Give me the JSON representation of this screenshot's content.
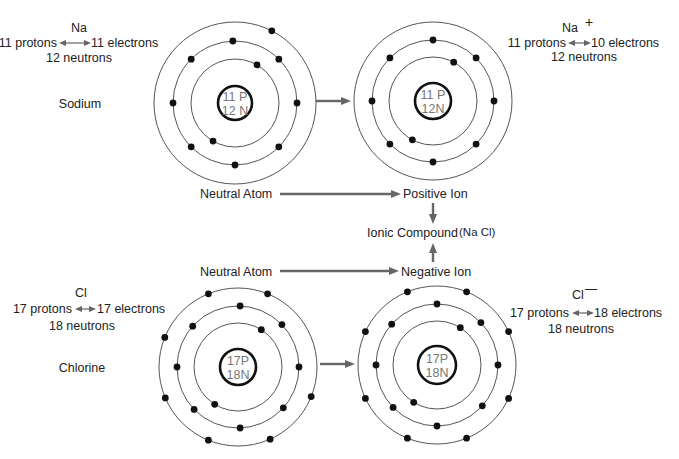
{
  "colors": {
    "text": "#222222",
    "nucleus_text": "#777777",
    "arrow": "#666666",
    "orbit": "#555555",
    "electron": "#111111"
  },
  "atoms": [
    {
      "id": "sodium-atom",
      "cx": 235,
      "cy": 103,
      "nucleus": {
        "r": 17,
        "line1": "11 P",
        "line2": "12 N"
      },
      "orbits": [
        44,
        62,
        81
      ],
      "electrons": {
        "inner": [
          -60,
          120
        ],
        "middle": [
          -92,
          -135,
          -45,
          180,
          0,
          135,
          45,
          90
        ],
        "outer": [
          -63
        ]
      },
      "symbol": "Na",
      "particle_line": {
        "protons": "11 protons",
        "electrons": "11 electrons"
      },
      "neutrons": "12 neutrons",
      "name": "Sodium"
    },
    {
      "id": "sodium-ion",
      "cx": 433,
      "cy": 101,
      "nucleus": {
        "r": 18,
        "line1": "11 P",
        "line2": "12N"
      },
      "orbits": [
        44,
        61,
        79
      ],
      "electrons": {
        "inner": [
          -62,
          118
        ],
        "middle": [
          -90,
          -135,
          -45,
          180,
          0,
          135,
          45,
          90
        ],
        "outer": []
      },
      "symbol": "Na",
      "charge": "+",
      "particle_line": {
        "protons": "11 protons",
        "electrons": "10 electrons"
      },
      "neutrons": "12 neutrons"
    },
    {
      "id": "chlorine-atom",
      "cx": 238,
      "cy": 367,
      "nucleus": {
        "r": 18,
        "line1": "17P",
        "line2": "18N"
      },
      "orbits": [
        44,
        61,
        79
      ],
      "electrons": {
        "inner": [
          -58,
          122
        ],
        "middle": [
          -88,
          -138,
          -44,
          180,
          0,
          136,
          42,
          88
        ],
        "outer": [
          -112,
          -68,
          -158,
          22,
          157,
          112,
          66
        ]
      },
      "symbol": "Cl",
      "particle_line": {
        "protons": "17 protons",
        "electrons": "17 electrons"
      },
      "neutrons": "18 neutrons",
      "name": "Chlorine"
    },
    {
      "id": "chloride-ion",
      "cx": 437,
      "cy": 365,
      "nucleus": {
        "r": 19,
        "line1": "17P",
        "line2": "18N"
      },
      "orbits": [
        44,
        61,
        79
      ],
      "electrons": {
        "inner": [
          -58,
          122
        ],
        "middle": [
          -90,
          -138,
          -44,
          180,
          0,
          136,
          42,
          90
        ],
        "outer": [
          -112,
          -68,
          -155,
          -25,
          25,
          155,
          112,
          68
        ]
      },
      "symbol": "Cl",
      "charge": "—",
      "particle_line": {
        "protons": "17 protons",
        "electrons": "18 electrons"
      },
      "neutrons": "18 neutrons"
    }
  ],
  "labels": {
    "na_symbol": "Na",
    "na_protons": "11 protons",
    "na_electrons": "11 electrons",
    "na_neutrons": "12 neutrons",
    "na_name": "Sodium",
    "naplus_symbol": "Na",
    "naplus_charge": "+",
    "naplus_protons": "11 protons",
    "naplus_electrons": "10 electrons",
    "naplus_neutrons": "12 neutrons",
    "cl_symbol": "Cl",
    "cl_protons": "17 protons",
    "cl_electrons": "17 electrons",
    "cl_neutrons": "18 neutrons",
    "cl_name": "Chlorine",
    "clminus_symbol": "Cl",
    "clminus_charge": "—",
    "clminus_protons": "17 protons",
    "clminus_electrons": "18 electrons",
    "clminus_neutrons": "18 neutrons"
  },
  "flow": {
    "top_neutral": "Neutral Atom",
    "positive_ion": "Positive Ion",
    "compound_label": "Ionic Compound",
    "compound_formula": "(Na Cl)",
    "bottom_neutral": "Neutral Atom",
    "negative_ion": "Negative Ion"
  }
}
